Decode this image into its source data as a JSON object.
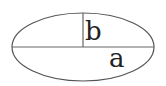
{
  "diagram": {
    "shape": "ellipse",
    "stroke_color": "#555555",
    "labels": {
      "semi_minor": "b",
      "semi_major": "a"
    }
  }
}
